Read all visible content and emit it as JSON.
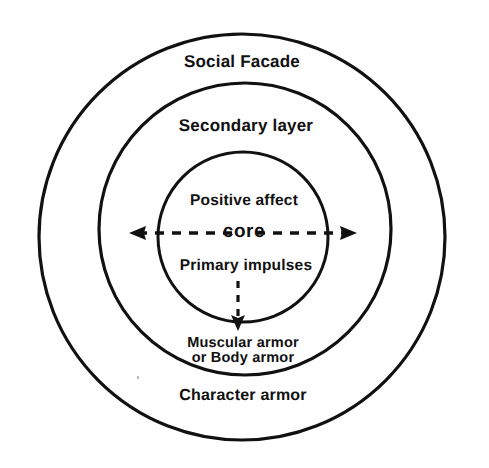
{
  "diagram": {
    "title_text": "",
    "background_color": "#ffffff",
    "stroke_color": "#111111",
    "text_color": "#111111",
    "center": {
      "x": 242,
      "y": 237
    },
    "rings": [
      {
        "name": "outer-ring",
        "radius": 203,
        "label": "Social Facade",
        "label_position": "top-inside",
        "secondary_label": "Character armor"
      },
      {
        "name": "middle-ring",
        "radius": 146,
        "label": "Secondary layer",
        "label_position": "top-inside",
        "secondary_label": "Muscular armor or Body armor"
      },
      {
        "name": "inner-ring",
        "radius": 85,
        "label": "core",
        "label_position": "center"
      }
    ],
    "labels": {
      "social_facade": "Social Facade",
      "secondary_layer": "Secondary layer",
      "positive_affect": "Positive affect",
      "core": "core",
      "primary_impulses": "Primary impulses",
      "muscular_armor_line1": "Muscular armor",
      "muscular_armor_line2": "or Body armor",
      "character_armor": "Character armor"
    },
    "arrows": [
      {
        "name": "arrow-left",
        "style": "dashed",
        "direction": "left",
        "from": {
          "x": 232,
          "y": 233
        },
        "to": {
          "x": 130,
          "y": 233
        }
      },
      {
        "name": "arrow-right",
        "style": "dashed",
        "direction": "right",
        "from": {
          "x": 256,
          "y": 233
        },
        "to": {
          "x": 357,
          "y": 233
        }
      },
      {
        "name": "arrow-down",
        "style": "dashed",
        "direction": "down",
        "from": {
          "x": 238,
          "y": 281
        },
        "to": {
          "x": 238,
          "y": 330
        }
      }
    ]
  }
}
